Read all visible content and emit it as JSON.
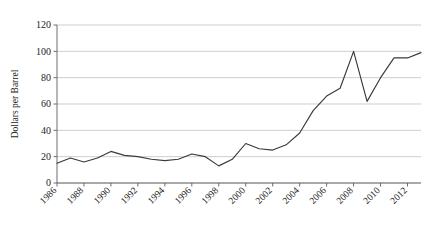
{
  "chart_data": {
    "type": "line",
    "title": "",
    "xlabel": "",
    "ylabel": "Dollars per Barrel",
    "xlim": [
      1986,
      2013
    ],
    "ylim": [
      0,
      120
    ],
    "yticks": [
      0,
      20,
      40,
      60,
      80,
      100,
      120
    ],
    "xticks": [
      1986,
      1988,
      1990,
      1992,
      1994,
      1996,
      1998,
      2000,
      2002,
      2004,
      2006,
      2008,
      2010,
      2012
    ],
    "xtick_labels": [
      "1986",
      "1988",
      "1990",
      "1992",
      "1994",
      "1996",
      "1998",
      "2000",
      "2002",
      "2004",
      "2006",
      "2008",
      "2010",
      "2012"
    ],
    "grid": "horizontal",
    "legend": "none",
    "x": [
      1986,
      1987,
      1988,
      1989,
      1990,
      1991,
      1992,
      1993,
      1994,
      1995,
      1996,
      1997,
      1998,
      1999,
      2000,
      2001,
      2002,
      2003,
      2004,
      2005,
      2006,
      2007,
      2008,
      2009,
      2010,
      2011,
      2012,
      2013
    ],
    "values": [
      15,
      19,
      16,
      19,
      24,
      21,
      20,
      18,
      17,
      18,
      22,
      20,
      13,
      18,
      30,
      26,
      25,
      29,
      38,
      55,
      66,
      72,
      100,
      62,
      80,
      95,
      95,
      99
    ],
    "series": [
      {
        "name": "Crude Oil Price",
        "values": [
          15,
          19,
          16,
          19,
          24,
          21,
          20,
          18,
          17,
          18,
          22,
          20,
          13,
          18,
          30,
          26,
          25,
          29,
          38,
          55,
          66,
          72,
          100,
          62,
          80,
          95,
          95,
          99
        ]
      }
    ],
    "line_color": "#3a3a3a",
    "grid_color": "#b9b9b9",
    "background_color": "#ffffff"
  }
}
